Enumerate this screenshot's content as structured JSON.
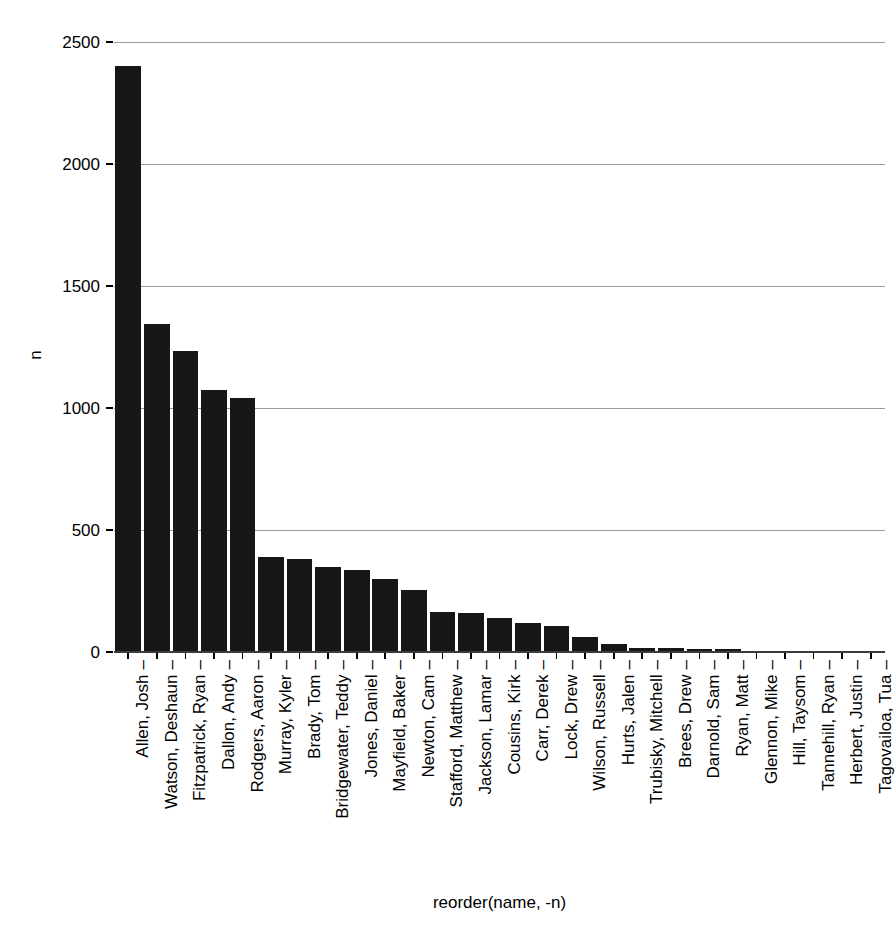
{
  "chart_data": {
    "type": "bar",
    "title": "",
    "subtitle": "",
    "xlabel": "reorder(name, -n)",
    "ylabel": "n",
    "ylim": [
      0,
      2500
    ],
    "yticks": [
      0,
      500,
      1000,
      1500,
      2000,
      2500
    ],
    "ytick_labels": [
      "0",
      "500",
      "1000",
      "1500",
      "2000",
      "2500"
    ],
    "grid": "horizontal",
    "legend": "none",
    "bar_color": "#171717",
    "gridline_color": "#9a9a9a",
    "background_color": "#ffffff",
    "categories": [
      "Allen, Josh",
      "Watson, Deshaun",
      "Fitzpatrick, Ryan",
      "Dallon, Andy",
      "Rodgers, Aaron",
      "Murray, Kyler",
      "Brady, Tom",
      "Bridgewater, Teddy",
      "Jones, Daniel",
      "Mayfield, Baker",
      "Newton, Cam",
      "Stafford, Matthew",
      "Jackson, Lamar",
      "Cousins, Kirk",
      "Carr, Derek",
      "Lock, Drew",
      "Wilson, Russell",
      "Hurts, Jalen",
      "Trubisky, Mitchell",
      "Brees, Drew",
      "Darnold, Sam",
      "Ryan, Matt",
      "Glennon, Mike",
      "Hill, Taysom",
      "Tannehill, Ryan",
      "Herbert, Justin",
      "Tagovailoa, Tua"
    ],
    "values": [
      2400,
      1345,
      1235,
      1075,
      1040,
      390,
      380,
      350,
      335,
      298,
      255,
      165,
      160,
      140,
      120,
      108,
      62,
      32,
      18,
      16,
      13,
      12,
      5,
      2,
      2,
      2,
      2
    ],
    "tick_dash": "–"
  }
}
